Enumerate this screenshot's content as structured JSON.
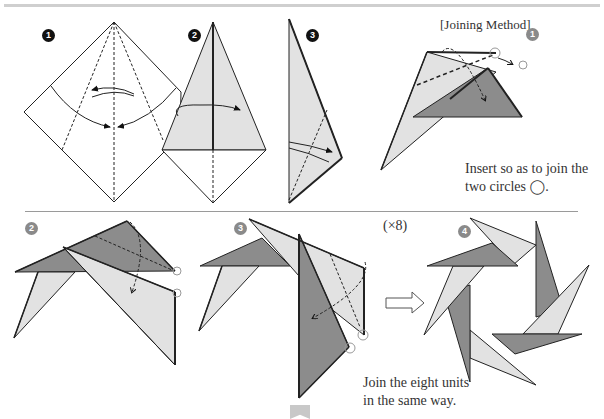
{
  "steps_top": [
    {
      "number": "1",
      "style": "dark"
    },
    {
      "number": "2",
      "style": "dark"
    },
    {
      "number": "3",
      "style": "dark"
    }
  ],
  "joining": {
    "title": "[Joining Method]",
    "step1": {
      "number": "1",
      "instruction_line1": "Insert so as to join the",
      "instruction_line2": "two circles ◯."
    },
    "step2": {
      "number": "2"
    },
    "step3": {
      "number": "3"
    },
    "step4": {
      "number": "4"
    },
    "repeat": "(×8)",
    "final_line1": "Join the eight units",
    "final_line2": "in the same way."
  },
  "colors": {
    "paper_light": "#e2e2e2",
    "paper_dark": "#8c8c8c",
    "line": "#1a1a1a"
  }
}
